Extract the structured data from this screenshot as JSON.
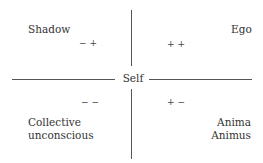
{
  "diagram": {
    "center": "Self",
    "quadrants": {
      "top_left": {
        "label": "Shadow",
        "sign": "− +"
      },
      "top_right": {
        "label": "Ego",
        "sign": "+ +"
      },
      "bottom_left": {
        "label_line1": "Collective",
        "label_line2": "unconscious",
        "sign": "− −"
      },
      "bottom_right": {
        "label_line1": "Anima",
        "label_line2": "Animus",
        "sign": "+ −"
      }
    }
  }
}
